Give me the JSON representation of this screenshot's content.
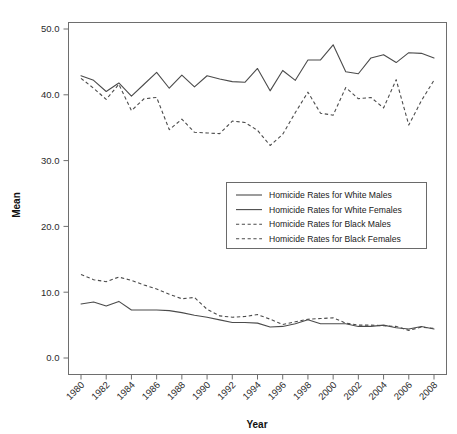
{
  "chart_data": {
    "type": "line",
    "title": "",
    "xlabel": "Year",
    "ylabel": "Mean",
    "xlim": [
      1980,
      2008
    ],
    "ylim": [
      0.0,
      50.0
    ],
    "grid": false,
    "legend_position": "center-right",
    "x": [
      1980,
      1981,
      1982,
      1983,
      1984,
      1985,
      1986,
      1987,
      1988,
      1989,
      1990,
      1991,
      1992,
      1993,
      1994,
      1995,
      1996,
      1997,
      1998,
      1999,
      2000,
      2001,
      2002,
      2003,
      2004,
      2005,
      2006,
      2007,
      2008
    ],
    "x_tick_labels": [
      "1980",
      "1982",
      "1984",
      "1986",
      "1988",
      "1990",
      "1992",
      "1994",
      "1996",
      "1998",
      "2000",
      "2002",
      "2004",
      "2006",
      "2008"
    ],
    "y_tick_labels": [
      "0.0",
      "10.0",
      "20.0",
      "30.0",
      "40.0",
      "50.0"
    ],
    "y_ticks": [
      0.0,
      10.0,
      20.0,
      30.0,
      40.0,
      50.0
    ],
    "series": [
      {
        "name": "Homicide Rates for White Males",
        "style": "solid",
        "color": "#4b4b4b",
        "values": [
          42.9,
          42.2,
          40.5,
          41.8,
          39.8,
          41.6,
          43.4,
          41.0,
          43.0,
          41.2,
          42.9,
          42.4,
          42.0,
          41.9,
          44.0,
          40.6,
          43.7,
          42.2,
          45.3,
          45.3,
          47.6,
          43.5,
          43.2,
          45.6,
          46.1,
          44.9,
          46.4,
          46.3,
          45.6
        ]
      },
      {
        "name": "Homicide Rates for White Females",
        "style": "solid",
        "color": "#4b4b4b",
        "values": [
          8.2,
          8.5,
          7.9,
          8.6,
          7.3,
          7.3,
          7.3,
          7.2,
          6.9,
          6.5,
          6.2,
          5.8,
          5.4,
          5.4,
          5.3,
          4.7,
          4.8,
          5.2,
          5.8,
          5.2,
          5.2,
          5.2,
          4.8,
          4.8,
          5.0,
          4.6,
          4.4,
          4.8,
          4.4
        ]
      },
      {
        "name": "Homicide Rates for Black Males",
        "style": "dashed",
        "color": "#4b4b4b",
        "values": [
          42.5,
          41.0,
          39.3,
          41.6,
          37.6,
          39.4,
          39.6,
          34.7,
          36.3,
          34.3,
          34.2,
          34.1,
          36.0,
          35.8,
          34.6,
          32.3,
          34.0,
          37.3,
          40.4,
          37.2,
          36.9,
          41.1,
          39.4,
          39.6,
          38.0,
          42.3,
          35.4,
          39.1,
          42.2
        ]
      },
      {
        "name": "Homicide Rates for Black Females",
        "style": "dashed",
        "color": "#4b4b4b",
        "values": [
          12.7,
          11.9,
          11.6,
          12.3,
          11.8,
          11.1,
          10.5,
          9.7,
          9.0,
          9.2,
          7.4,
          6.4,
          6.2,
          6.3,
          6.6,
          5.9,
          5.1,
          5.5,
          5.9,
          6.0,
          6.1,
          5.3,
          5.0,
          5.0,
          4.9,
          4.8,
          4.2,
          4.7,
          4.5
        ]
      }
    ]
  },
  "legend": {
    "entries": [
      {
        "label": "Homicide Rates for White Males",
        "style": "solid"
      },
      {
        "label": "Homicide Rates for White Females",
        "style": "solid"
      },
      {
        "label": "Homicide Rates for Black Males",
        "style": "dashed"
      },
      {
        "label": "Homicide Rates for Black Females",
        "style": "dashed"
      }
    ]
  }
}
